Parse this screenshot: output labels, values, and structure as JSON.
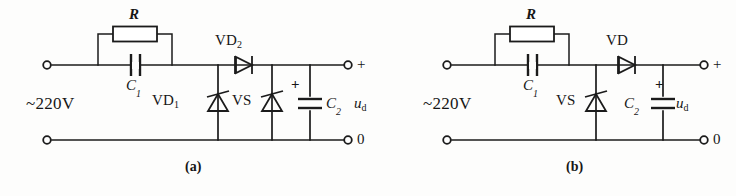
{
  "figure": {
    "type": "electronic-schematic",
    "background_color": "#fdfdfc",
    "line_color": "#1b1b1b"
  },
  "circuits": [
    {
      "id": "a",
      "caption": "(a)",
      "source_label": "~220V",
      "terminal_top_label": "+",
      "terminal_bottom_label": "0",
      "output_label": "u",
      "output_label_sub": "d",
      "components": [
        {
          "name": "resistor-r",
          "label": "R",
          "sub": "",
          "kind": "resistor"
        },
        {
          "name": "capacitor-c1",
          "label": "C",
          "sub": "1",
          "kind": "capacitor"
        },
        {
          "name": "diode-vd1",
          "label": "VD",
          "sub": "1",
          "kind": "trigger-diode"
        },
        {
          "name": "diode-vd2",
          "label": "VD",
          "sub": "2",
          "kind": "diode"
        },
        {
          "name": "switch-vs",
          "label": "VS",
          "sub": "",
          "kind": "trigger-diode"
        },
        {
          "name": "capacitor-c2",
          "label": "C",
          "sub": "2",
          "kind": "polarized-capacitor",
          "polarity": "+"
        }
      ]
    },
    {
      "id": "b",
      "caption": "(b)",
      "source_label": "~220V",
      "terminal_top_label": "+",
      "terminal_bottom_label": "0",
      "output_label": "u",
      "output_label_sub": "d",
      "components": [
        {
          "name": "resistor-r",
          "label": "R",
          "sub": "",
          "kind": "resistor"
        },
        {
          "name": "capacitor-c1",
          "label": "C",
          "sub": "1",
          "kind": "capacitor"
        },
        {
          "name": "switch-vs",
          "label": "VS",
          "sub": "",
          "kind": "trigger-diode"
        },
        {
          "name": "diode-vd",
          "label": "VD",
          "sub": "",
          "kind": "diode"
        },
        {
          "name": "capacitor-c2",
          "label": "C",
          "sub": "2",
          "kind": "polarized-capacitor",
          "polarity": "+"
        }
      ]
    }
  ],
  "symbols": {
    "plus": "+",
    "zero": "0",
    "tilde": "~"
  }
}
